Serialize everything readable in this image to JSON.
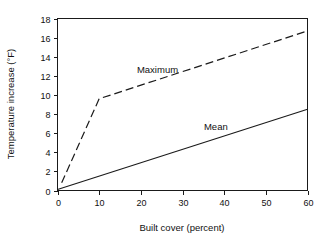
{
  "chart_data": {
    "type": "line",
    "title": "",
    "subtitle": "",
    "xlabel": "Built cover (percent)",
    "ylabel": "Temperature increase (°F)",
    "xlim": [
      0,
      60
    ],
    "ylim": [
      0,
      18
    ],
    "xticks": [
      0,
      10,
      20,
      30,
      40,
      50,
      60
    ],
    "yticks": [
      0,
      2,
      4,
      6,
      8,
      10,
      12,
      14,
      16,
      18
    ],
    "xtick_labels": [
      "0",
      "10",
      "20",
      "30",
      "40",
      "50",
      "60"
    ],
    "ytick_labels": [
      "0",
      "2",
      "4",
      "6",
      "8",
      "10",
      "12",
      "14",
      "16",
      "18"
    ],
    "grid": false,
    "legend_position": "inline-annotations",
    "line_color": "#1a1a1a",
    "series": [
      {
        "name": "Maximum",
        "style": "dashed",
        "annotation": "Maximum",
        "annotation_x": 24,
        "annotation_y": 12.3,
        "x": [
          1,
          10,
          60
        ],
        "values": [
          0.8,
          9.6,
          16.7
        ]
      },
      {
        "name": "Mean",
        "style": "solid",
        "annotation": "Mean",
        "annotation_x": 38,
        "annotation_y": 6.3,
        "x": [
          0,
          60
        ],
        "values": [
          0.1,
          8.5
        ]
      }
    ]
  },
  "axis_titles": {
    "x": "Built cover (percent)",
    "y": "Temperature increase (°F)"
  },
  "annotations": {
    "maximum_label": "Maximum",
    "mean_label": "Mean"
  }
}
